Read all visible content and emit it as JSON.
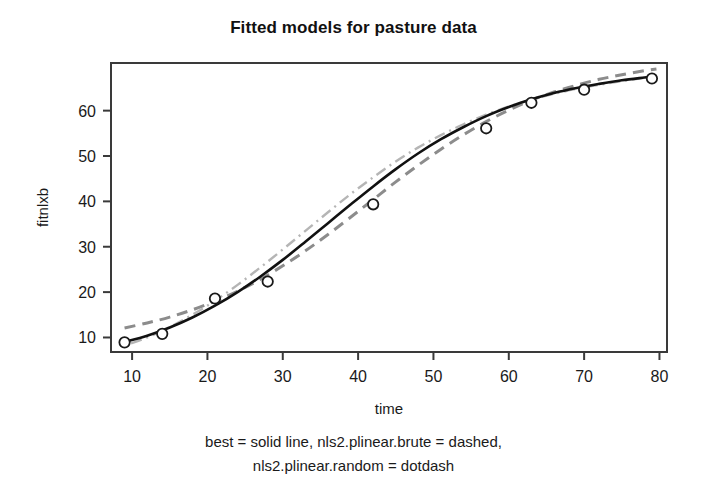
{
  "figure": {
    "title": "Fitted models for pasture data",
    "caption_line_1": "best = solid line, nls2.plinear.brute = dashed,",
    "caption_line_2": "nls2.plinear.random = dotdash",
    "background_color": "#ffffff",
    "frame_color": "#3a3a3a"
  },
  "chart_data": {
    "type": "line",
    "title": "Fitted models for pasture data",
    "xlabel": "time",
    "ylabel": "fitnlxb",
    "xlim": [
      7.2,
      81.0
    ],
    "ylim": [
      6.8,
      70.5
    ],
    "xticks": [
      10,
      20,
      30,
      40,
      50,
      60,
      70,
      80
    ],
    "xticklabels": [
      "10",
      "20",
      "30",
      "40",
      "50",
      "60",
      "70",
      "80"
    ],
    "yticks": [
      10,
      20,
      30,
      40,
      50,
      60
    ],
    "yticklabels": [
      "10",
      "20",
      "30",
      "40",
      "50",
      "60"
    ],
    "grid": false,
    "legend": "caption-below-plot",
    "points": {
      "name": "observed pasture data",
      "marker": "open-circle",
      "color": "#1a1a1a",
      "x": [
        9,
        14,
        21,
        28,
        42,
        57,
        63,
        70,
        79
      ],
      "y": [
        8.93,
        10.8,
        18.59,
        22.33,
        39.35,
        56.11,
        61.73,
        64.62,
        67.08
      ]
    },
    "series": [
      {
        "name": "best",
        "style": "solid",
        "color": "#111111",
        "width": 2.6,
        "x": [
          9,
          12,
          15,
          18,
          21,
          24,
          27,
          30,
          33,
          36,
          39,
          42,
          45,
          48,
          51,
          54,
          57,
          60,
          63,
          66,
          69,
          72,
          75,
          78,
          79.6
        ],
        "y": [
          9.0,
          10.4,
          12.2,
          14.4,
          17.0,
          20.0,
          23.4,
          27.1,
          31.1,
          35.2,
          39.3,
          43.3,
          47.1,
          50.6,
          53.7,
          56.4,
          58.8,
          60.8,
          62.5,
          63.9,
          65.0,
          65.9,
          66.7,
          67.3,
          67.6
        ]
      },
      {
        "name": "nls2.plinear.brute",
        "style": "dashed",
        "color": "#8c8c8c",
        "width": 3.0,
        "x": [
          9,
          12,
          15,
          18,
          21,
          24,
          27,
          30,
          33,
          36,
          39,
          42,
          45,
          48,
          51,
          54,
          57,
          60,
          63,
          66,
          69,
          72,
          75,
          78,
          79.6
        ],
        "y": [
          12.1,
          13.2,
          14.5,
          16.1,
          18.0,
          20.2,
          22.8,
          25.8,
          29.1,
          32.7,
          36.5,
          40.4,
          44.3,
          48.0,
          51.5,
          54.7,
          57.6,
          60.1,
          62.3,
          64.1,
          65.6,
          66.9,
          67.9,
          68.8,
          69.2
        ]
      },
      {
        "name": "nls2.plinear.random",
        "style": "dotdash",
        "color": "#b5b5b5",
        "width": 2.4,
        "x": [
          9,
          12,
          15,
          18,
          21,
          24,
          27,
          30,
          33,
          36,
          39,
          42,
          45,
          48,
          51,
          54,
          57,
          60,
          63,
          66,
          69,
          72,
          75,
          78,
          79.6
        ],
        "y": [
          8.2,
          10.0,
          12.3,
          15.0,
          18.1,
          21.6,
          25.4,
          29.4,
          33.5,
          37.6,
          41.6,
          45.3,
          48.8,
          51.9,
          54.6,
          57.0,
          59.1,
          60.9,
          62.4,
          63.7,
          64.8,
          65.7,
          66.5,
          67.2,
          67.5
        ]
      }
    ]
  }
}
